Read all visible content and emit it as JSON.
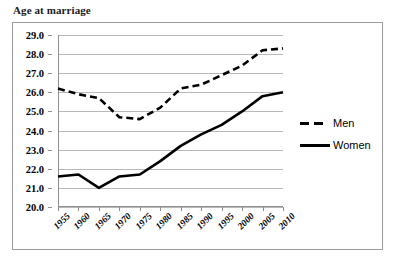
{
  "chart_data": {
    "type": "line",
    "title": "Age at marriage",
    "xlabel": "",
    "ylabel": "",
    "x": [
      1955,
      1960,
      1965,
      1970,
      1975,
      1980,
      1985,
      1990,
      1995,
      2000,
      2005,
      2010
    ],
    "categories": [
      "1955",
      "1960",
      "1965",
      "1970",
      "1975",
      "1980",
      "1985",
      "1990",
      "1995",
      "2000",
      "2005",
      "2010"
    ],
    "ylim": [
      20.0,
      29.0
    ],
    "yticks": [
      20.0,
      21.0,
      22.0,
      23.0,
      24.0,
      25.0,
      26.0,
      27.0,
      28.0,
      29.0
    ],
    "ytick_labels": [
      "20.0",
      "21.0",
      "22.0",
      "23.0",
      "24.0",
      "25.0",
      "26.0",
      "27.0",
      "28.0",
      "29.0"
    ],
    "grid": true,
    "legend_position": "right",
    "series": [
      {
        "name": "Men",
        "style": "dashed",
        "color": "#000000",
        "values": [
          26.2,
          25.9,
          25.7,
          24.7,
          24.6,
          25.2,
          26.2,
          26.4,
          26.9,
          27.4,
          28.2,
          28.3
        ]
      },
      {
        "name": "Women",
        "style": "solid",
        "color": "#000000",
        "values": [
          21.6,
          21.7,
          21.0,
          21.6,
          21.7,
          22.4,
          23.2,
          23.8,
          24.3,
          25.0,
          25.8,
          26.0
        ]
      }
    ]
  },
  "legend": {
    "items": [
      {
        "label": "Men",
        "style": "dashed"
      },
      {
        "label": "Women",
        "style": "solid"
      }
    ]
  }
}
